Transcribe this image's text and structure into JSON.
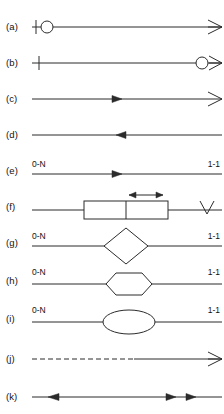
{
  "diagram": {
    "type": "notation-legend",
    "stroke_color": "#2b2b2b",
    "fill_color": "#ffffff",
    "background_color": "#ffffff",
    "rows": [
      {
        "key": "a",
        "label": "(a)",
        "left_marker": "cross-tick",
        "left_symbol": "circle",
        "right_marker": "crows-foot",
        "line_style": "solid",
        "mid_arrow": "none",
        "shape": "none",
        "left_cardinality": "",
        "right_cardinality": ""
      },
      {
        "key": "b",
        "label": "(b)",
        "left_marker": "cross-tick",
        "left_symbol": "none",
        "right_marker": "circle-crows-foot",
        "line_style": "solid",
        "mid_arrow": "none",
        "shape": "none",
        "left_cardinality": "",
        "right_cardinality": ""
      },
      {
        "key": "c",
        "label": "(c)",
        "left_marker": "none",
        "left_symbol": "none",
        "right_marker": "crows-foot",
        "line_style": "solid",
        "mid_arrow": "right",
        "shape": "none",
        "left_cardinality": "",
        "right_cardinality": ""
      },
      {
        "key": "d",
        "label": "(d)",
        "left_marker": "none",
        "left_symbol": "none",
        "right_marker": "none",
        "line_style": "solid",
        "mid_arrow": "left",
        "shape": "none",
        "left_cardinality": "",
        "right_cardinality": ""
      },
      {
        "key": "e",
        "label": "(e)",
        "left_marker": "none",
        "left_symbol": "none",
        "right_marker": "none",
        "line_style": "solid",
        "mid_arrow": "right",
        "shape": "none",
        "left_cardinality": "0-N",
        "right_cardinality": "1-1"
      },
      {
        "key": "f",
        "label": "(f)",
        "left_marker": "none",
        "left_symbol": "none",
        "right_marker": "vee",
        "line_style": "solid",
        "mid_arrow": "double-above",
        "shape": "split-rectangle",
        "left_cardinality": "",
        "right_cardinality": ""
      },
      {
        "key": "g",
        "label": "(g)",
        "left_marker": "none",
        "left_symbol": "none",
        "right_marker": "none",
        "line_style": "solid",
        "mid_arrow": "none",
        "shape": "diamond",
        "left_cardinality": "0-N",
        "right_cardinality": "1-1"
      },
      {
        "key": "h",
        "label": "(h)",
        "left_marker": "none",
        "left_symbol": "none",
        "right_marker": "none",
        "line_style": "solid",
        "mid_arrow": "none",
        "shape": "hexagon",
        "left_cardinality": "0-N",
        "right_cardinality": "1-1"
      },
      {
        "key": "i",
        "label": "(i)",
        "left_marker": "none",
        "left_symbol": "none",
        "right_marker": "none",
        "line_style": "solid",
        "mid_arrow": "none",
        "shape": "ellipse",
        "left_cardinality": "0-N",
        "right_cardinality": "1-1"
      },
      {
        "key": "j",
        "label": "(j)",
        "left_marker": "none",
        "left_symbol": "none",
        "right_marker": "crows-foot",
        "line_style": "dashed-then-solid",
        "mid_arrow": "none",
        "shape": "none",
        "left_cardinality": "",
        "right_cardinality": ""
      },
      {
        "key": "k",
        "label": "(k)",
        "left_marker": "none",
        "left_symbol": "none",
        "right_marker": "none",
        "line_style": "solid",
        "mid_arrow": "left-and-double-right",
        "shape": "none",
        "left_cardinality": "",
        "right_cardinality": ""
      }
    ]
  }
}
